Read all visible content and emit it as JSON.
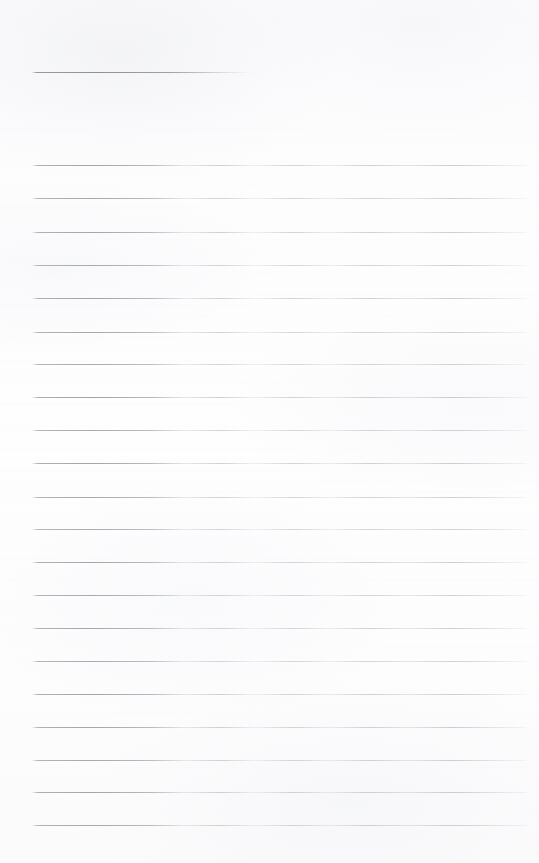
{
  "document": {
    "kind": "ruled-notepaper-scan",
    "title": "Blank Ruled Note Page",
    "state": "empty",
    "written_text": "",
    "page_width": 539,
    "page_height": 863,
    "paper_color": "#fdfdfe",
    "rule_color": "#94969d",
    "rule_thickness_px": 1,
    "left_margin_px": 32,
    "right_margin_px": 527,
    "line_spacing_px": 33,
    "total_rules": 22
  },
  "rules": [
    {
      "id": "rule-1",
      "y": 72,
      "x1": 32,
      "x2": 256,
      "variant": "short",
      "opacity": 0.95
    },
    {
      "id": "rule-2",
      "y": 165,
      "x1": 32,
      "x2": 527,
      "variant": "full",
      "opacity": 0.92
    },
    {
      "id": "rule-3",
      "y": 198,
      "x1": 32,
      "x2": 527,
      "variant": "full",
      "opacity": 0.88
    },
    {
      "id": "rule-4",
      "y": 232,
      "x1": 32,
      "x2": 527,
      "variant": "full",
      "opacity": 0.9
    },
    {
      "id": "rule-5",
      "y": 265,
      "x1": 32,
      "x2": 527,
      "variant": "full",
      "opacity": 0.86
    },
    {
      "id": "rule-6",
      "y": 298,
      "x1": 32,
      "x2": 527,
      "variant": "full",
      "opacity": 0.93
    },
    {
      "id": "rule-7",
      "y": 332,
      "x1": 32,
      "x2": 527,
      "variant": "full",
      "opacity": 0.89
    },
    {
      "id": "rule-8",
      "y": 364,
      "x1": 32,
      "x2": 527,
      "variant": "full",
      "opacity": 0.85
    },
    {
      "id": "rule-9",
      "y": 397,
      "x1": 32,
      "x2": 527,
      "variant": "full",
      "opacity": 0.94
    },
    {
      "id": "rule-10",
      "y": 430,
      "x1": 32,
      "x2": 527,
      "variant": "full",
      "opacity": 0.87
    },
    {
      "id": "rule-11",
      "y": 463,
      "x1": 32,
      "x2": 527,
      "variant": "full",
      "opacity": 0.91
    },
    {
      "id": "rule-12",
      "y": 497,
      "x1": 32,
      "x2": 527,
      "variant": "full",
      "opacity": 0.88
    },
    {
      "id": "rule-13",
      "y": 529,
      "x1": 32,
      "x2": 527,
      "variant": "full",
      "opacity": 0.84
    },
    {
      "id": "rule-14",
      "y": 562,
      "x1": 32,
      "x2": 527,
      "variant": "full",
      "opacity": 0.9
    },
    {
      "id": "rule-15",
      "y": 595,
      "x1": 32,
      "x2": 527,
      "variant": "full",
      "opacity": 0.86
    },
    {
      "id": "rule-16",
      "y": 628,
      "x1": 32,
      "x2": 527,
      "variant": "full",
      "opacity": 0.89
    },
    {
      "id": "rule-17",
      "y": 661,
      "x1": 32,
      "x2": 527,
      "variant": "full",
      "opacity": 0.85
    },
    {
      "id": "rule-18",
      "y": 694,
      "x1": 32,
      "x2": 527,
      "variant": "full",
      "opacity": 0.92
    },
    {
      "id": "rule-19",
      "y": 727,
      "x1": 32,
      "x2": 527,
      "variant": "full",
      "opacity": 0.9
    },
    {
      "id": "rule-20",
      "y": 760,
      "x1": 32,
      "x2": 527,
      "variant": "full",
      "opacity": 0.87
    },
    {
      "id": "rule-21",
      "y": 792,
      "x1": 32,
      "x2": 527,
      "variant": "full",
      "opacity": 0.91
    },
    {
      "id": "rule-22",
      "y": 825,
      "x1": 32,
      "x2": 527,
      "variant": "full",
      "opacity": 0.88
    }
  ]
}
